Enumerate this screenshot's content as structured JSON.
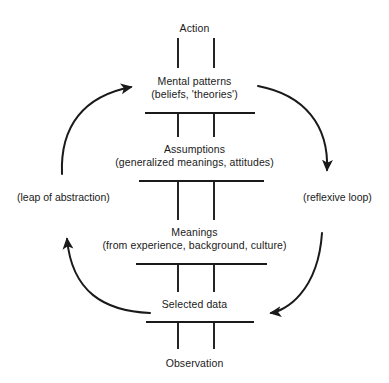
{
  "diagram": {
    "name": "ladder-of-inference",
    "background_color": "#ffffff",
    "ink_color": "#1a1a1a",
    "ladder": {
      "rail_left_x": 178,
      "rail_right_x": 214,
      "center_x": 196,
      "steps": [
        {
          "id": "action",
          "title": "Action",
          "subtitle": "",
          "label_y": 22,
          "rung": null
        },
        {
          "id": "mental-patterns",
          "title": "Mental patterns",
          "subtitle": "(beliefs, 'theories')",
          "label_y": 75,
          "rung": {
            "y": 113,
            "x1": 145,
            "x2": 255
          }
        },
        {
          "id": "assumptions",
          "title": "Assumptions",
          "subtitle": "(generalized meanings, attitudes)",
          "label_y": 143,
          "rung": {
            "y": 181,
            "x1": 139,
            "x2": 264
          }
        },
        {
          "id": "meanings",
          "title": "Meanings",
          "subtitle": "(from experience, background, culture)",
          "label_y": 226,
          "rung": {
            "y": 264,
            "x1": 136,
            "x2": 267
          }
        },
        {
          "id": "selected-data",
          "title": "Selected data",
          "subtitle": "",
          "label_y": 298,
          "rung": {
            "y": 322,
            "x1": 146,
            "x2": 254
          }
        },
        {
          "id": "observation",
          "title": "Observation",
          "subtitle": "",
          "label_y": 357,
          "rung": null
        }
      ]
    },
    "loops": [
      {
        "id": "leap-of-abstraction",
        "label": "(leap of abstraction)",
        "label_x": 17,
        "label_y": 191,
        "side": "left"
      },
      {
        "id": "reflexive-loop",
        "label": "(reflexive loop)",
        "label_x": 303,
        "label_y": 191,
        "side": "right"
      }
    ],
    "arrows": [
      {
        "id": "arrow-upper-left",
        "direction": "up-right",
        "description": "curves up from mid-left to Mental patterns"
      },
      {
        "id": "arrow-lower-left",
        "direction": "up",
        "description": "curves from Selected data up-left to Meanings"
      },
      {
        "id": "arrow-upper-right",
        "direction": "down",
        "description": "curves from Mental patterns down-right to mid-right"
      },
      {
        "id": "arrow-lower-right",
        "direction": "left",
        "description": "curves down-right then left into Selected data"
      }
    ]
  }
}
